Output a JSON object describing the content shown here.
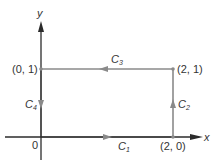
{
  "diagram": {
    "type": "closed rectangular contour in xy-plane",
    "colors": {
      "axis": "#2b2b2b",
      "path": "#8a8a8a",
      "text": "#333333",
      "background": "#ffffff"
    },
    "axes": {
      "x_label": "x",
      "y_label": "y",
      "origin_label": "0"
    },
    "points": [
      {
        "id": "p00",
        "label": "(0, 1)"
      },
      {
        "id": "p21",
        "label": "(2, 1)"
      },
      {
        "id": "p20",
        "label": "(2, 0)"
      }
    ],
    "segments": [
      {
        "id": "C1",
        "letter": "C",
        "sub": "1",
        "from": "(0, 0)",
        "to": "(2, 0)",
        "direction": "right"
      },
      {
        "id": "C2",
        "letter": "C",
        "sub": "2",
        "from": "(2, 0)",
        "to": "(2, 1)",
        "direction": "up"
      },
      {
        "id": "C3",
        "letter": "C",
        "sub": "3",
        "from": "(2, 1)",
        "to": "(0, 1)",
        "direction": "left"
      },
      {
        "id": "C4",
        "letter": "C",
        "sub": "4",
        "from": "(0, 1)",
        "to": "(0, 0)",
        "direction": "down"
      }
    ]
  }
}
